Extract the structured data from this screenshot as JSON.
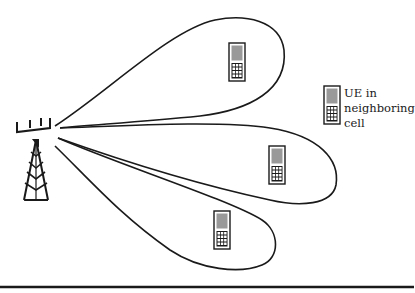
{
  "diagram": {
    "type": "cellular-beamforming-illustration",
    "elements": {
      "base_station": {
        "icon": "cell-tower-icon"
      },
      "beams": [
        {
          "id": "beam-upper",
          "direction": "upper-right",
          "contains_ue": true
        },
        {
          "id": "beam-middle",
          "direction": "right",
          "contains_ue": true
        },
        {
          "id": "beam-lower",
          "direction": "lower-right",
          "contains_ue": true
        }
      ],
      "user_equipment": [
        {
          "id": "ue-1",
          "beam": "beam-upper"
        },
        {
          "id": "ue-2",
          "beam": "beam-middle"
        },
        {
          "id": "ue-3",
          "beam": "beam-lower"
        }
      ]
    },
    "legend": {
      "icon": "mobile-phone-icon",
      "lines": [
        "UE in",
        "neighboring",
        "cell"
      ]
    },
    "colors": {
      "stroke": "#1a1a1a",
      "phone_screen": "#999999",
      "background": "#ffffff"
    }
  }
}
